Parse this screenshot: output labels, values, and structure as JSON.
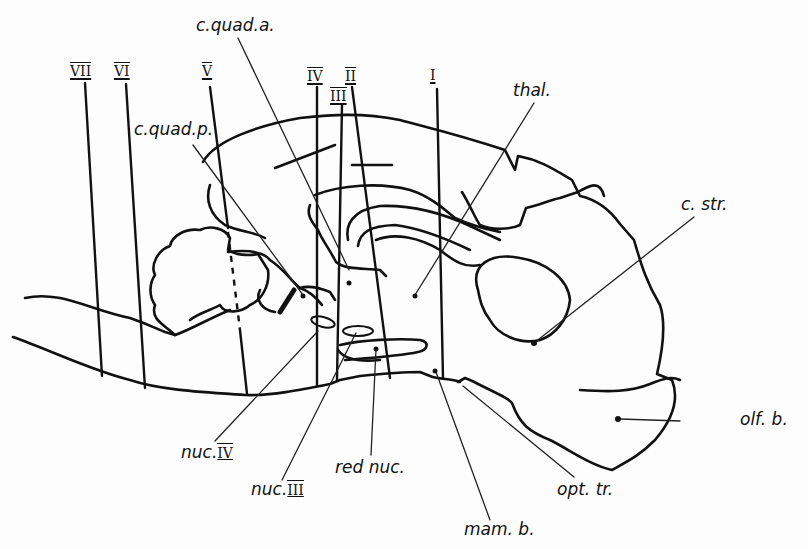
{
  "figure": {
    "type": "sagittal brain section diagram",
    "section_markers": [
      {
        "id": "VII",
        "label": "VII"
      },
      {
        "id": "VI",
        "label": "VI"
      },
      {
        "id": "V",
        "label": "V"
      },
      {
        "id": "IV",
        "label": "IV"
      },
      {
        "id": "III",
        "label": "III"
      },
      {
        "id": "II",
        "label": "II"
      },
      {
        "id": "I",
        "label": "I"
      }
    ],
    "labels": {
      "c_quad_a": "c.quad.a.",
      "c_quad_p": "c.quad.p.",
      "thal": "thal.",
      "c_str": "c. str.",
      "olf_b": "olf. b.",
      "opt_tr": "opt. tr.",
      "mam_b": "mam. b.",
      "red_nuc": "red nuc.",
      "nuc_III_prefix": "nuc.",
      "nuc_III_num": "III",
      "nuc_IV_prefix": "nuc.",
      "nuc_IV_num": "IV"
    },
    "colors": {
      "ink": "#111111",
      "paper": "#fdfdfd"
    }
  }
}
